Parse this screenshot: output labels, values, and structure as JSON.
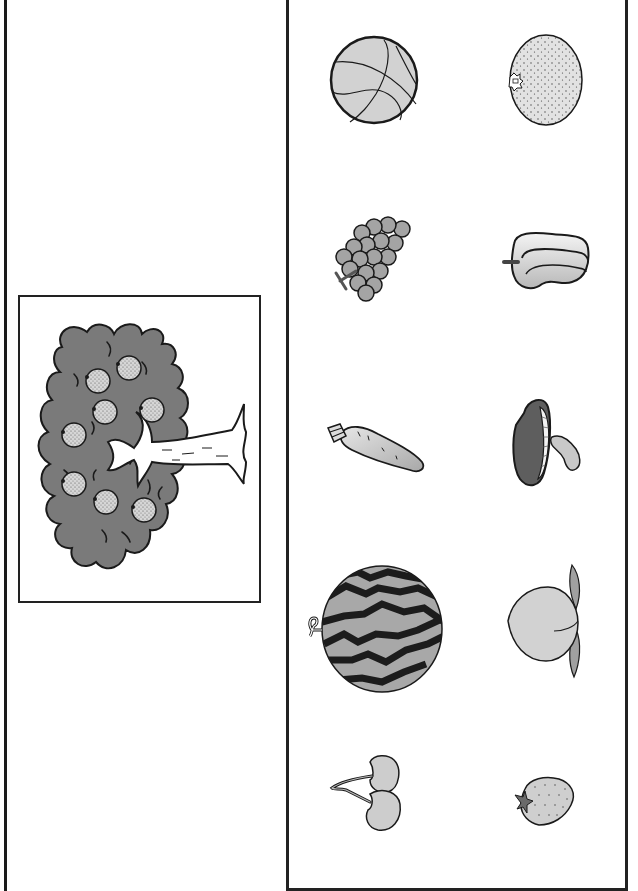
{
  "worksheet": {
    "type": "matching-worksheet",
    "left_panel": {
      "picture": "tree",
      "description": "Tree with round dotted fruits (oranges) growing on it",
      "fruit_count": 8,
      "colors": {
        "canopy": "#7a7a7a",
        "fruit": "#cfcfcf",
        "trunk": "#ffffff",
        "outline": "#1a1a1a"
      }
    },
    "right_panel": {
      "items": [
        {
          "id": "basketball",
          "label": "Basketball",
          "row": 1,
          "col": 1
        },
        {
          "id": "orange",
          "label": "Orange",
          "row": 1,
          "col": 2
        },
        {
          "id": "grapes",
          "label": "Grapes",
          "row": 2,
          "col": 1
        },
        {
          "id": "bell-pepper",
          "label": "Bell pepper",
          "row": 2,
          "col": 2
        },
        {
          "id": "carrot",
          "label": "Carrot",
          "row": 3,
          "col": 1
        },
        {
          "id": "mushroom",
          "label": "Mushroom",
          "row": 3,
          "col": 2
        },
        {
          "id": "watermelon",
          "label": "Watermelon",
          "row": 4,
          "col": 1
        },
        {
          "id": "peach",
          "label": "Peach",
          "row": 4,
          "col": 2
        },
        {
          "id": "cherries",
          "label": "Cherries",
          "row": 5,
          "col": 1
        },
        {
          "id": "strawberry",
          "label": "Strawberry",
          "row": 5,
          "col": 2
        }
      ],
      "colors": {
        "light_fill": "#d2d2d2",
        "mid_fill": "#a8a8a8",
        "dark_fill": "#5e5e5e",
        "stripe": "#1c1c1c",
        "outline": "#1a1a1a"
      }
    }
  }
}
